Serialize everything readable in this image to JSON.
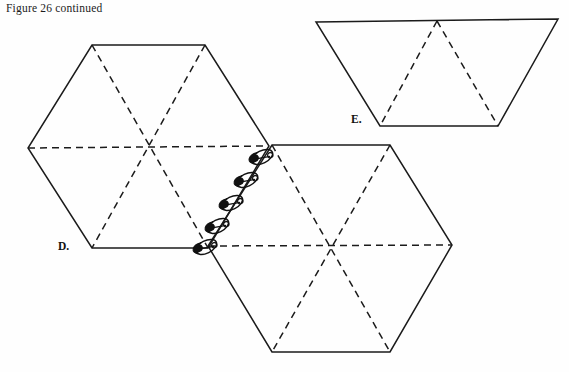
{
  "figure": {
    "caption": "Figure 26 continued",
    "background_color": "#fefefe",
    "ink_color": "#1b1b1b",
    "width": 569,
    "height": 372
  },
  "labels": {
    "d": "D.",
    "e": "E."
  },
  "shapes": {
    "hexagon_d": {
      "name": "D.",
      "type": "hexagon",
      "outline_style": "solid",
      "fold_line_style": "dashed",
      "vertices": [
        [
          92,
          45
        ],
        [
          205,
          45
        ],
        [
          269,
          146
        ],
        [
          208,
          248
        ],
        [
          92,
          248
        ],
        [
          28,
          148
        ]
      ],
      "fold_lines": [
        [
          [
            28,
            148
          ],
          [
            269,
            146
          ]
        ],
        [
          [
            92,
            45
          ],
          [
            208,
            248
          ]
        ],
        [
          [
            205,
            45
          ],
          [
            92,
            248
          ]
        ]
      ]
    },
    "hexagon_lower": {
      "name": "lower-hexagon",
      "type": "hexagon",
      "outline_style": "solid",
      "fold_line_style": "dashed",
      "vertices": [
        [
          272,
          145
        ],
        [
          390,
          145
        ],
        [
          452,
          245
        ],
        [
          390,
          352
        ],
        [
          272,
          352
        ],
        [
          208,
          246
        ]
      ],
      "fold_lines": [
        [
          [
            208,
            246
          ],
          [
            452,
            245
          ]
        ],
        [
          [
            272,
            145
          ],
          [
            390,
            352
          ]
        ],
        [
          [
            390,
            145
          ],
          [
            272,
            352
          ]
        ]
      ]
    },
    "trapezoid_e": {
      "name": "E.",
      "type": "trapezoid",
      "outline_style": "solid",
      "fold_line_style": "dashed",
      "vertices": [
        [
          316,
          22
        ],
        [
          558,
          19
        ],
        [
          498,
          126
        ],
        [
          380,
          126
        ]
      ],
      "fold_lines": [
        [
          [
            437,
            21
          ],
          [
            380,
            126
          ]
        ],
        [
          [
            437,
            21
          ],
          [
            498,
            126
          ]
        ]
      ]
    }
  },
  "safety_pins": {
    "name": "safety-pins",
    "count": 5,
    "along_edge": [
      [
        269,
        146
      ],
      [
        208,
        246
      ]
    ],
    "description": "five safety pins fastening the right edge of hexagon D to the left edge of the lower hexagon",
    "pins": [
      {
        "x": 262,
        "y": 157,
        "angle": -26
      },
      {
        "x": 247,
        "y": 180,
        "angle": -26
      },
      {
        "x": 232,
        "y": 203,
        "angle": -26
      },
      {
        "x": 218,
        "y": 226,
        "angle": -26
      },
      {
        "x": 207,
        "y": 247,
        "angle": -26
      }
    ]
  }
}
